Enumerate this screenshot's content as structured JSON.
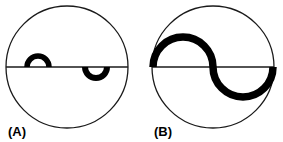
{
  "figure": {
    "background_color": "#ffffff",
    "stroke_color": "#1a1a1a",
    "feature_color": "#000000",
    "panel_count": 2
  },
  "panels": [
    {
      "id": "A",
      "label": "(A)",
      "label_x": 8,
      "label_y": 136,
      "circle": {
        "cx": 67,
        "cy": 67,
        "r": 61,
        "stroke_width": 1.3,
        "fill": "none"
      },
      "diameter_line": {
        "x1": 6,
        "y1": 67,
        "x2": 128,
        "y2": 67,
        "stroke_width": 1.3
      },
      "features": [
        {
          "name": "upper-left-arc",
          "shape": "semicircular-arc",
          "cx": 38,
          "cy": 67,
          "r": 11,
          "side": "above",
          "stroke_width": 5.5
        },
        {
          "name": "lower-right-arc",
          "shape": "semicircular-arc",
          "cx": 96,
          "cy": 67,
          "r": 11,
          "side": "below",
          "stroke_width": 6.0
        }
      ]
    },
    {
      "id": "B",
      "label": "(B)",
      "label_x": 154,
      "label_y": 136,
      "circle": {
        "cx": 213,
        "cy": 67,
        "r": 61,
        "stroke_width": 1.3,
        "fill": "none"
      },
      "diameter_line": {
        "x1": 152,
        "y1": 67,
        "x2": 274,
        "y2": 67,
        "stroke_width": 1.3
      },
      "features": [
        {
          "name": "upper-left-arc",
          "shape": "semicircular-arc",
          "cx": 183,
          "cy": 67,
          "r": 30,
          "side": "above",
          "stroke_width": 7.5
        },
        {
          "name": "lower-right-arc",
          "shape": "semicircular-arc",
          "cx": 243,
          "cy": 67,
          "r": 30,
          "side": "below",
          "stroke_width": 7.5
        }
      ]
    }
  ]
}
